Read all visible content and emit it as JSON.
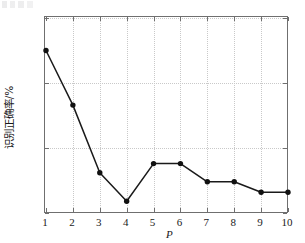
{
  "chart_data": {
    "type": "line",
    "title": "",
    "xlabel": "P",
    "ylabel": "识别正确率/%",
    "x": [
      1,
      2,
      3,
      4,
      5,
      6,
      7,
      8,
      9,
      10
    ],
    "values": [
      99.25,
      98.83,
      98.31,
      98.09,
      98.38,
      98.38,
      98.24,
      98.24,
      98.16,
      98.16
    ],
    "series": [
      {
        "name": "识别正确率",
        "values": [
          99.25,
          98.83,
          98.31,
          98.09,
          98.38,
          98.38,
          98.24,
          98.24,
          98.16,
          98.16
        ]
      }
    ],
    "xlim": [
      1,
      10
    ],
    "ylim": [
      98,
      99.5
    ],
    "xticks": [
      "1",
      "2",
      "3",
      "4",
      "5",
      "6",
      "7",
      "8",
      "9",
      "10"
    ],
    "yticks": [
      "98",
      "98.5",
      "99",
      "99.5"
    ],
    "ytick_values": [
      98,
      98.5,
      99,
      99.5
    ],
    "grid": true,
    "legend": "none",
    "marker": "filled-circle",
    "line_color": "#1a1a1a",
    "marker_color": "#111111",
    "grid_color": "#c9c9c9",
    "frame_color": "#6f6f6f"
  },
  "axes": {
    "x_title": "P",
    "y_title": "识别正确率/%"
  }
}
